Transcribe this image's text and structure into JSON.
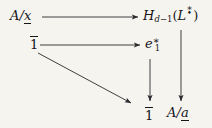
{
  "figure": {
    "kind": "commutative-diagram",
    "background_color": "#f6f4ef",
    "ink_color": "#16161a",
    "width": 212,
    "height": 128
  },
  "nodes": {
    "top_left": {
      "id": "A-mod-x",
      "text": "A/x̲",
      "parts": {
        "numerator": "A",
        "slash": "/",
        "denominator": "x",
        "denominator_decoration": "underbar"
      },
      "x": 10,
      "y": 10
    },
    "top_right": {
      "id": "H-d-minus-1-L",
      "text": "H_{d-1}(L^•*)",
      "parts": {
        "letter": "H",
        "subscript": "d−1",
        "open": "(",
        "inner": "L",
        "inner_decoration": "star-over-bullet",
        "close": ")"
      },
      "x": 143,
      "y": 8
    },
    "mid_left": {
      "id": "one-bar-upper",
      "text": "1̄",
      "parts": {
        "numeral": "1",
        "decoration": "overbar"
      },
      "x": 30,
      "y": 36
    },
    "mid_right": {
      "id": "e-1-star",
      "text": "e₁*",
      "parts": {
        "letter": "e",
        "subscript": "1",
        "superscript": "*"
      },
      "x": 145,
      "y": 35
    },
    "bottom_left": {
      "id": "one-bar-lower",
      "text": "1̄",
      "parts": {
        "numeral": "1",
        "decoration": "overbar"
      },
      "x": 140,
      "y": 107
    },
    "bottom_right": {
      "id": "A-mod-a",
      "text": "A/a̲",
      "parts": {
        "numerator": "A",
        "slash": "/",
        "denominator": "a",
        "denominator_decoration": "underbar"
      },
      "x": 168,
      "y": 105
    }
  },
  "arrows": [
    {
      "id": "arrow-top-horizontal",
      "from": "A-mod-x",
      "to": "H-d-minus-1-L",
      "direction": "right",
      "label": "",
      "x1": 42,
      "y1": 17,
      "x2": 139,
      "y2": 17
    },
    {
      "id": "arrow-mid-horizontal",
      "from": "one-bar-upper",
      "to": "e-1-star",
      "direction": "right",
      "label": "",
      "x1": 40,
      "y1": 45,
      "x2": 141,
      "y2": 45
    },
    {
      "id": "arrow-diagonal",
      "from": "one-bar-upper",
      "to": "one-bar-lower",
      "direction": "down-right",
      "label": "",
      "x1": 38,
      "y1": 53,
      "x2": 132,
      "y2": 104
    },
    {
      "id": "arrow-vertical-middle",
      "from": "e-1-star",
      "to": "one-bar-lower",
      "direction": "down",
      "label": "",
      "x1": 150,
      "y1": 58,
      "x2": 150,
      "y2": 102
    },
    {
      "id": "arrow-vertical-right",
      "from": "H-d-minus-1-L",
      "to": "A-mod-a",
      "direction": "down",
      "label": "",
      "x1": 181,
      "y1": 28,
      "x2": 181,
      "y2": 101
    }
  ]
}
